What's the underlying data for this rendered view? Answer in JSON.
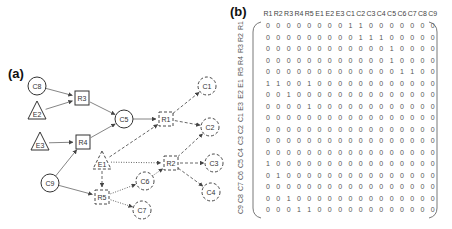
{
  "panel_a": {
    "label": "(a)",
    "nodes": [
      {
        "id": "C8",
        "shape": "circle",
        "style": "solid",
        "x": 37,
        "y": 86
      },
      {
        "id": "E2",
        "shape": "triangle",
        "style": "solid",
        "x": 37,
        "y": 112
      },
      {
        "id": "E3",
        "shape": "triangle",
        "style": "solid",
        "x": 40,
        "y": 143
      },
      {
        "id": "R3",
        "shape": "square",
        "style": "solid",
        "x": 82,
        "y": 98
      },
      {
        "id": "R4",
        "shape": "square",
        "style": "solid",
        "x": 83,
        "y": 142
      },
      {
        "id": "C5",
        "shape": "circle",
        "style": "solid",
        "x": 124,
        "y": 119
      },
      {
        "id": "C9",
        "shape": "circle",
        "style": "solid",
        "x": 50,
        "y": 183
      },
      {
        "id": "R1",
        "shape": "square",
        "style": "dashed",
        "x": 166,
        "y": 119
      },
      {
        "id": "C1",
        "shape": "circle",
        "style": "dashed",
        "x": 207,
        "y": 86
      },
      {
        "id": "C2",
        "shape": "circle",
        "style": "dashed",
        "x": 210,
        "y": 127
      },
      {
        "id": "E1",
        "shape": "triangle",
        "style": "dashed",
        "x": 102,
        "y": 162
      },
      {
        "id": "R2",
        "shape": "square",
        "style": "dashed",
        "x": 171,
        "y": 163
      },
      {
        "id": "C3",
        "shape": "circle",
        "style": "dashed",
        "x": 214,
        "y": 163
      },
      {
        "id": "C4",
        "shape": "circle",
        "style": "dashed",
        "x": 211,
        "y": 192
      },
      {
        "id": "C6",
        "shape": "circle",
        "style": "dashed",
        "x": 145,
        "y": 181
      },
      {
        "id": "R5",
        "shape": "square",
        "style": "dashed",
        "x": 102,
        "y": 197
      },
      {
        "id": "C7",
        "shape": "circle",
        "style": "dashed",
        "x": 142,
        "y": 210
      }
    ],
    "edges": [
      {
        "from": "C8",
        "to": "R3",
        "style": "solid"
      },
      {
        "from": "E2",
        "to": "R3",
        "style": "solid"
      },
      {
        "from": "E3",
        "to": "R4",
        "style": "solid"
      },
      {
        "from": "C9",
        "to": "R4",
        "style": "solid"
      },
      {
        "from": "R3",
        "to": "C5",
        "style": "solid"
      },
      {
        "from": "R4",
        "to": "C5",
        "style": "solid"
      },
      {
        "from": "C5",
        "to": "R1",
        "style": "solid"
      },
      {
        "from": "C9",
        "to": "R5",
        "style": "solid"
      },
      {
        "from": "R1",
        "to": "C1",
        "style": "dashed"
      },
      {
        "from": "R1",
        "to": "C2",
        "style": "dashed"
      },
      {
        "from": "E1",
        "to": "R1",
        "style": "dashed"
      },
      {
        "from": "E1",
        "to": "R2",
        "style": "dotted"
      },
      {
        "from": "E1",
        "to": "R5",
        "style": "dashed"
      },
      {
        "from": "R2",
        "to": "C2",
        "style": "dashed"
      },
      {
        "from": "R2",
        "to": "C3",
        "style": "dashed"
      },
      {
        "from": "R2",
        "to": "C4",
        "style": "dashed"
      },
      {
        "from": "C6",
        "to": "R2",
        "style": "dotted"
      },
      {
        "from": "R5",
        "to": "C6",
        "style": "dotted"
      },
      {
        "from": "R5",
        "to": "C7",
        "style": "dotted"
      }
    ]
  },
  "panel_b": {
    "label": "(b)",
    "columns": [
      "R1",
      "R2",
      "R3",
      "R4",
      "R5",
      "E1",
      "E2",
      "E3",
      "C1",
      "C2",
      "C3",
      "C4",
      "C5",
      "C6",
      "C7",
      "C8",
      "C9"
    ],
    "rows": [
      "R1",
      "R2",
      "R3",
      "R4",
      "R5",
      "E1",
      "E2",
      "E3",
      "C1",
      "C2",
      "C3",
      "C4",
      "C5",
      "C6",
      "C7",
      "C8",
      "C9"
    ],
    "values": [
      [
        0,
        0,
        0,
        0,
        0,
        0,
        0,
        0,
        1,
        1,
        0,
        0,
        0,
        0,
        0,
        0,
        0
      ],
      [
        0,
        0,
        0,
        0,
        0,
        0,
        0,
        0,
        0,
        1,
        1,
        1,
        0,
        0,
        0,
        0,
        0
      ],
      [
        0,
        0,
        0,
        0,
        0,
        0,
        0,
        0,
        0,
        0,
        0,
        0,
        1,
        0,
        0,
        0,
        0
      ],
      [
        0,
        0,
        0,
        0,
        0,
        0,
        0,
        0,
        0,
        0,
        0,
        0,
        1,
        0,
        0,
        0,
        0
      ],
      [
        0,
        0,
        0,
        0,
        0,
        0,
        0,
        0,
        0,
        0,
        0,
        0,
        0,
        1,
        1,
        0,
        0
      ],
      [
        1,
        1,
        0,
        0,
        1,
        0,
        0,
        0,
        0,
        0,
        0,
        0,
        0,
        0,
        0,
        0,
        0
      ],
      [
        0,
        0,
        1,
        0,
        0,
        0,
        0,
        0,
        0,
        0,
        0,
        0,
        0,
        0,
        0,
        0,
        0
      ],
      [
        0,
        0,
        0,
        0,
        1,
        0,
        0,
        0,
        0,
        0,
        0,
        0,
        0,
        0,
        0,
        0,
        0
      ],
      [
        0,
        0,
        0,
        0,
        0,
        0,
        0,
        0,
        0,
        0,
        0,
        0,
        0,
        0,
        0,
        0,
        0
      ],
      [
        0,
        0,
        0,
        0,
        0,
        0,
        0,
        0,
        0,
        0,
        0,
        0,
        0,
        0,
        0,
        0,
        0
      ],
      [
        0,
        0,
        0,
        0,
        0,
        0,
        0,
        0,
        0,
        0,
        0,
        0,
        0,
        0,
        0,
        0,
        0
      ],
      [
        0,
        0,
        0,
        0,
        0,
        0,
        0,
        0,
        0,
        0,
        0,
        0,
        0,
        0,
        0,
        0,
        0
      ],
      [
        1,
        0,
        0,
        0,
        0,
        0,
        0,
        0,
        0,
        0,
        0,
        0,
        0,
        0,
        0,
        0,
        0
      ],
      [
        0,
        1,
        0,
        0,
        0,
        0,
        0,
        0,
        0,
        0,
        0,
        0,
        0,
        0,
        0,
        0,
        0
      ],
      [
        0,
        0,
        0,
        0,
        0,
        0,
        0,
        0,
        0,
        0,
        0,
        0,
        0,
        0,
        0,
        0,
        0
      ],
      [
        0,
        0,
        1,
        0,
        0,
        0,
        0,
        0,
        0,
        0,
        0,
        0,
        0,
        0,
        0,
        0,
        0
      ],
      [
        0,
        0,
        0,
        1,
        1,
        0,
        0,
        0,
        0,
        0,
        0,
        0,
        0,
        0,
        0,
        0,
        0
      ]
    ]
  },
  "colors": {
    "stroke": "#444444",
    "text": "#333333",
    "background": "#ffffff"
  }
}
